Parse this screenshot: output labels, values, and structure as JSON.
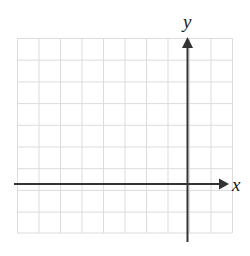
{
  "figure": {
    "kind": "blank-coordinate-grid",
    "background_color": "#ffffff",
    "width": 250,
    "height": 256
  },
  "grid": {
    "line_color": "#dcdcdc",
    "line_width": 1,
    "left": 17,
    "top": 38,
    "right": 232,
    "bottom": 233,
    "columns": 10,
    "rows": 9,
    "cell_width": 21.5,
    "cell_height": 21.7
  },
  "axes": {
    "color": "#333333",
    "line_width": 2,
    "x_axis": {
      "label": "x",
      "orientation": "horizontal",
      "y_position": 184,
      "start_x": 14,
      "end_x": 225,
      "arrow": "right-arrowhead",
      "arrow_tip_x": 228
    },
    "y_axis": {
      "label": "y",
      "orientation": "vertical",
      "x_position": 187,
      "start_y": 242,
      "end_y": 42,
      "arrow": "up-arrowhead",
      "arrow_tip_y": 38
    },
    "origin": {
      "x": 187,
      "y": 184
    }
  },
  "data_points": [],
  "tick_labels": {
    "x": [],
    "y": []
  },
  "plotted_curves": []
}
